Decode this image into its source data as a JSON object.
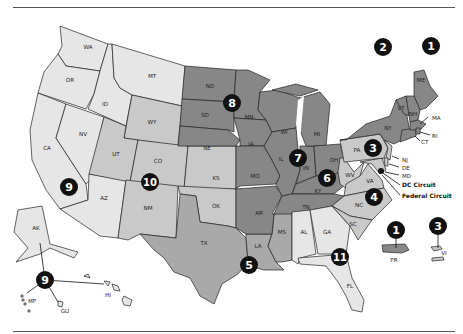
{
  "colors": {
    "tone_lightest": "#e6e6e6",
    "tone_light": "#c9c9c9",
    "tone_mid": "#a9a9a9",
    "tone_dark": "#878787",
    "border": "#222222",
    "badge": "#111111",
    "badge_text": "#ffffff"
  },
  "states": {
    "WA": "WA",
    "OR": "OR",
    "ID": "ID",
    "MT": "MT",
    "CA": "CA",
    "NV": "NV",
    "AZ": "AZ",
    "AK": "AK",
    "HI": "HI",
    "MP": "MP",
    "GU": "GU",
    "UT": "UT",
    "CO": "CO",
    "WY": "WY",
    "NM": "NM",
    "KS": "KS",
    "OK": "OK",
    "ND": "ND",
    "SD": "SD",
    "NE": "NE",
    "MN": "MN",
    "IA": "IA",
    "MO": "MO",
    "AR": "AR",
    "WI": "WI",
    "IL": "IL",
    "IN": "IN",
    "MI": "MI",
    "OH": "OH",
    "KY": "KY",
    "TN": "TN",
    "TX": "TX",
    "LA": "LA",
    "MS": "MS",
    "AL": "AL",
    "GA": "GA",
    "FL": "FL",
    "WV": "WV",
    "VA": "VA",
    "NC": "NC",
    "SC": "SC",
    "MD": "MD",
    "PA": "PA",
    "NJ": "NJ",
    "DE": "DE",
    "VI": "VI",
    "NY": "NY",
    "VT": "VT",
    "CT": "CT",
    "ME": "ME",
    "NH": "NH",
    "MA": "MA",
    "RI": "RI",
    "PR": "PR"
  },
  "callouts": {
    "dc_circuit": "DC Circuit",
    "federal_circuit": "Federal Circuit"
  },
  "circuits": [
    {
      "number": "1",
      "x": 431,
      "y": 46
    },
    {
      "number": "2",
      "x": 383,
      "y": 47
    },
    {
      "number": "3",
      "x": 373,
      "y": 148
    },
    {
      "number": "4",
      "x": 374,
      "y": 197
    },
    {
      "number": "5",
      "x": 249,
      "y": 265
    },
    {
      "number": "6",
      "x": 327,
      "y": 178
    },
    {
      "number": "7",
      "x": 298,
      "y": 158
    },
    {
      "number": "8",
      "x": 232,
      "y": 103
    },
    {
      "number": "9",
      "x": 69,
      "y": 187
    },
    {
      "number": "10",
      "x": 150,
      "y": 182
    },
    {
      "number": "11",
      "x": 340,
      "y": 257
    },
    {
      "number": "1",
      "x": 396,
      "y": 230
    },
    {
      "number": "3",
      "x": 438,
      "y": 226
    },
    {
      "number": "9",
      "x": 45,
      "y": 280
    }
  ]
}
